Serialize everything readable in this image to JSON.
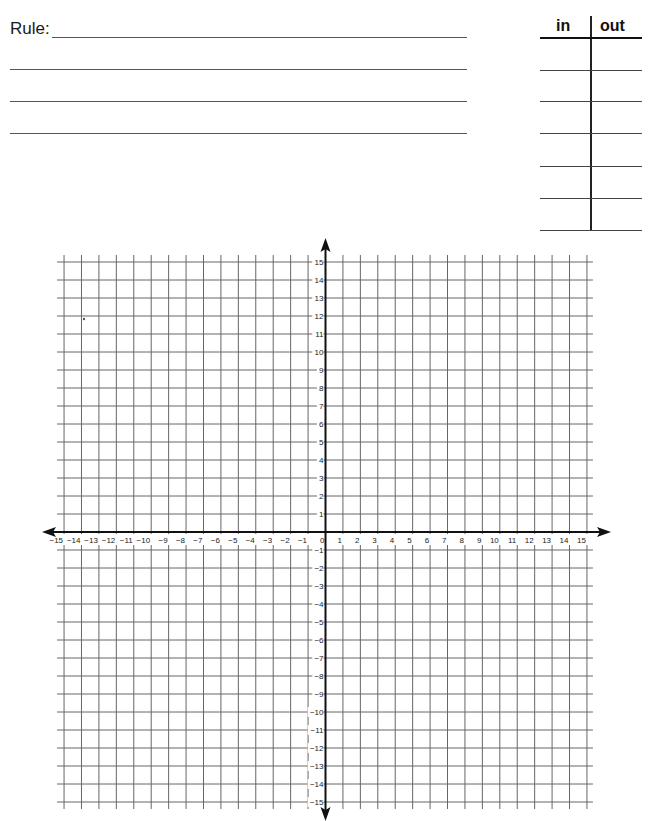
{
  "worksheet": {
    "rule_label": "Rule:",
    "rule_lines": [
      {
        "x1": 52,
        "x2": 467,
        "y": 37
      },
      {
        "x1": 10,
        "x2": 467,
        "y": 69
      },
      {
        "x1": 10,
        "x2": 467,
        "y": 101
      },
      {
        "x1": 10,
        "x2": 467,
        "y": 133
      }
    ],
    "io_table": {
      "headers": {
        "in": "in",
        "out": "out"
      },
      "row_lines_y": [
        37,
        70,
        101,
        133,
        166,
        198,
        230
      ],
      "rows": [
        {
          "in": "",
          "out": ""
        },
        {
          "in": "",
          "out": ""
        },
        {
          "in": "",
          "out": ""
        },
        {
          "in": "",
          "out": ""
        },
        {
          "in": "",
          "out": ""
        },
        {
          "in": "",
          "out": ""
        }
      ]
    }
  },
  "graph": {
    "x_range": [
      -15,
      15
    ],
    "y_range": [
      -15,
      15
    ],
    "origin_px": {
      "x": 325.5,
      "y": 532
    },
    "unit_px": {
      "x": 17.43,
      "y": 18
    },
    "grid_color": "#666666",
    "axis_color": "#111111",
    "x_tick_labels": [
      "−15",
      "−14",
      "−13",
      "−12",
      "−11",
      "−10",
      "−9",
      "−8",
      "−7",
      "−6",
      "−5",
      "−4",
      "−3",
      "−2",
      "−1",
      "0",
      "1",
      "2",
      "3",
      "4",
      "5",
      "6",
      "7",
      "8",
      "9",
      "10",
      "11",
      "12",
      "13",
      "14",
      "15"
    ],
    "y_tick_labels": [
      "15",
      "14",
      "13",
      "12",
      "11",
      "10",
      "9",
      "8",
      "7",
      "6",
      "5",
      "4",
      "3",
      "2",
      "1",
      "−1",
      "−2",
      "−3",
      "−4",
      "−5",
      "−6",
      "−7",
      "−8",
      "−9",
      "−10",
      "−11",
      "−12",
      "−13",
      "−14",
      "−15"
    ],
    "stray_mark": {
      "x": 84,
      "y": 319
    }
  }
}
